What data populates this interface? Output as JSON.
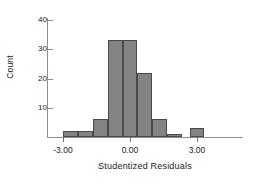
{
  "chart_data": {
    "type": "bar",
    "title": "",
    "subtitle": "",
    "xlabel": "Studentized Residuals",
    "ylabel": "Count",
    "xlim": [
      -3.6,
      4.2
    ],
    "ylim": [
      0,
      43
    ],
    "grid": false,
    "legend": null,
    "bin_width": 0.67,
    "xticks": [
      -3.0,
      0.0,
      3.0
    ],
    "xtick_labels": [
      "-3.00",
      "0.00",
      "3.00"
    ],
    "yticks": [
      10,
      20,
      30,
      40
    ],
    "ytick_labels": [
      "10",
      "20",
      "30",
      "40"
    ],
    "bar_color": "#838383",
    "bar_edge_color": "#4a4a4a",
    "axis_color": "#8d8d8d",
    "background": "#ffffff",
    "bins": [
      {
        "x_left": -3.0,
        "x_right": -2.33,
        "center": -2.67,
        "value": 2
      },
      {
        "x_left": -2.33,
        "x_right": -1.67,
        "center": -2.0,
        "value": 2
      },
      {
        "x_left": -1.67,
        "x_right": -1.0,
        "center": -1.33,
        "value": 6
      },
      {
        "x_left": -1.0,
        "x_right": -0.33,
        "center": -0.67,
        "value": 33
      },
      {
        "x_left": -0.33,
        "x_right": 0.33,
        "center": 0.0,
        "value": 33
      },
      {
        "x_left": 0.33,
        "x_right": 1.0,
        "center": 0.67,
        "value": 22
      },
      {
        "x_left": 1.0,
        "x_right": 1.67,
        "center": 1.33,
        "value": 6
      },
      {
        "x_left": 1.67,
        "x_right": 2.33,
        "center": 2.0,
        "value": 1
      },
      {
        "x_left": 2.67,
        "x_right": 3.33,
        "center": 3.0,
        "value": 3
      }
    ],
    "categories": [
      "-2.67",
      "-2.00",
      "-1.33",
      "-0.67",
      "0.00",
      "0.67",
      "1.33",
      "2.00",
      "3.00"
    ],
    "values": [
      2,
      2,
      6,
      33,
      33,
      22,
      6,
      1,
      3
    ]
  }
}
